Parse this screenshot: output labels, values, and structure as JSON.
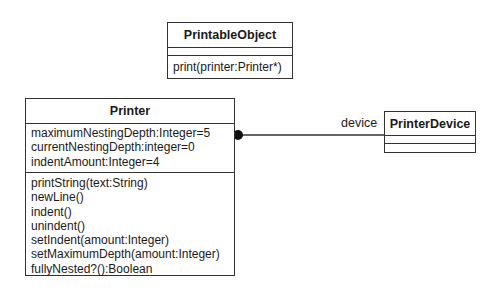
{
  "diagram": {
    "type": "UML class diagram",
    "classes": [
      {
        "id": "printable-object",
        "name": "PrintableObject",
        "attributes": [],
        "operations": [
          "print(printer:Printer*)"
        ]
      },
      {
        "id": "printer",
        "name": "Printer",
        "attributes": [
          "maximumNestingDepth:Integer=5",
          "currentNestingDepth:integer=0",
          "indentAmount:Integer=4"
        ],
        "operations": [
          "printString(text:String)",
          "newLine()",
          "indent()",
          "unindent()",
          "setIndent(amount:Integer)",
          "setMaximumDepth(amount:Integer)",
          "fullyNested?():Boolean"
        ]
      },
      {
        "id": "printer-device",
        "name": "PrinterDevice",
        "attributes": [],
        "operations": []
      }
    ],
    "associations": [
      {
        "from": "Printer",
        "to": "PrinterDevice",
        "role": "device",
        "from_end": "filled-circle"
      }
    ],
    "colors": {
      "stroke": "#333333",
      "text": "#1a1a1a",
      "background": "#ffffff"
    }
  }
}
